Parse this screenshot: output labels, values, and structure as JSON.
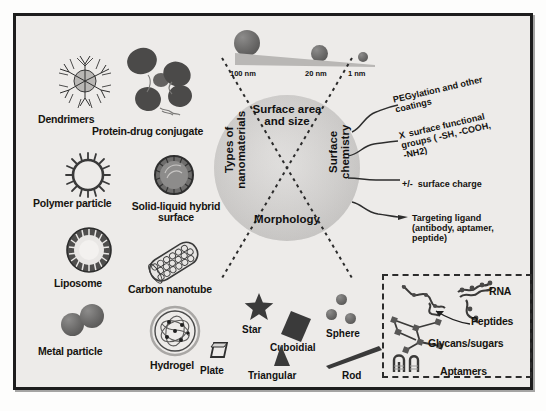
{
  "figure": {
    "background_color": "#edebe9",
    "frame_color": "#1d1d1d"
  },
  "center_wheel": {
    "quadrants": [
      {
        "id": "surface-area-size",
        "label": "Surface area\nand size",
        "position": "top"
      },
      {
        "id": "surface-chemistry",
        "label": "Surface\nchemistry",
        "position": "right"
      },
      {
        "id": "morphology",
        "label": "Morphology",
        "position": "bottom"
      },
      {
        "id": "types-of-nanomaterials",
        "label": "Types of\nnanomaterials",
        "position": "left"
      }
    ],
    "fill_color": "#cdcbc9"
  },
  "size_scale": {
    "ticks": [
      {
        "label": "100 nm",
        "diameter_px": 22
      },
      {
        "label": "20 nm",
        "diameter_px": 14
      },
      {
        "label": "1 nm",
        "diameter_px": 8
      }
    ],
    "particle_color": "#6f6e6d"
  },
  "nanomaterial_types": [
    {
      "id": "dendrimers",
      "label": "Dendrimers"
    },
    {
      "id": "protein-drug-conjugate",
      "label": "Protein-drug conjugate"
    },
    {
      "id": "polymer-particle",
      "label": "Polymer particle"
    },
    {
      "id": "solid-liquid-hybrid-surface",
      "label": "Solid-liquid\nhybrid surface"
    },
    {
      "id": "liposome",
      "label": "Liposome"
    },
    {
      "id": "carbon-nanotube",
      "label": "Carbon nanotube"
    },
    {
      "id": "metal-particle",
      "label": "Metal particle"
    },
    {
      "id": "hydrogel",
      "label": "Hydrogel"
    }
  ],
  "surface_chemistry": [
    {
      "id": "pegylation",
      "marker": "",
      "label": "PEGylation and other\ncoatings"
    },
    {
      "id": "functional-groups",
      "marker": "X",
      "label": "surface functional\ngroups ( -SH, -COOH,\n-NH2)"
    },
    {
      "id": "surface-charge",
      "marker": "+/-",
      "label": "surface charge"
    },
    {
      "id": "targeting-ligand",
      "marker": "",
      "label": "Targeting ligand\n(antibody, aptamer, peptide)"
    }
  ],
  "biomolecules": [
    {
      "id": "rna",
      "label": "RNA"
    },
    {
      "id": "peptides",
      "label": "Peptides"
    },
    {
      "id": "glycans-sugars",
      "label": "Glycans/sugars"
    },
    {
      "id": "aptamers",
      "label": "Aptamers"
    }
  ],
  "morphology_shapes": [
    {
      "id": "star",
      "label": "Star"
    },
    {
      "id": "cuboidial",
      "label": "Cuboidial"
    },
    {
      "id": "sphere",
      "label": "Sphere"
    },
    {
      "id": "plate",
      "label": "Plate"
    },
    {
      "id": "triangular",
      "label": "Triangular"
    },
    {
      "id": "rod",
      "label": "Rod"
    }
  ]
}
